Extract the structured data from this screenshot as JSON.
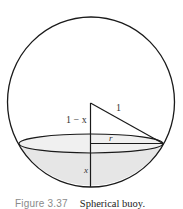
{
  "figure": {
    "labels": {
      "one_minus_x": "1 − x",
      "hypotenuse": "1",
      "radius": "r",
      "depth": "x"
    },
    "caption": {
      "number": "Figure 3.37",
      "text": "Spherical buoy."
    },
    "colors": {
      "stroke": "#1a1a1a",
      "water_fill": "#e6e6e6",
      "caption_number": "#8a8a8a",
      "caption_text": "#222222"
    }
  }
}
